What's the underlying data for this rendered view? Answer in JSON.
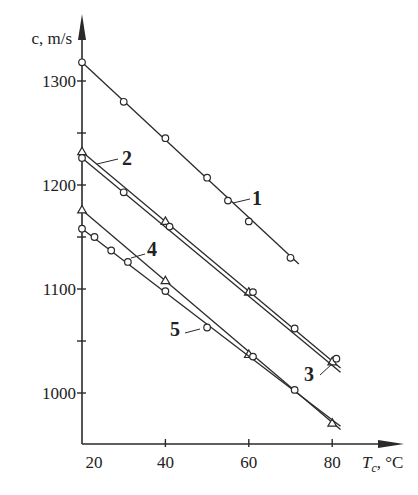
{
  "chart_data": {
    "type": "line",
    "title": "",
    "xlabel": "T_c, °C",
    "xlabel_main": "T",
    "xlabel_sub": "c",
    "xlabel_unit": ", °C",
    "ylabel": "c, m/s",
    "xlim": [
      20,
      87
    ],
    "ylim": [
      950,
      1330
    ],
    "x_ticks": [
      20,
      40,
      60,
      80
    ],
    "x_tick_labels": [
      "20",
      "40",
      "60",
      "80"
    ],
    "y_ticks": [
      1000,
      1100,
      1200,
      1300
    ],
    "y_tick_labels": [
      "1000",
      "1100",
      "1200",
      "1300"
    ],
    "y_minor_ticks": [
      1050,
      1150,
      1250
    ],
    "grid": false,
    "legend": "inline numeric labels",
    "series": [
      {
        "name": "1",
        "marker": "circle",
        "x": [
          20,
          30,
          40,
          50,
          55,
          60,
          70
        ],
        "y": [
          1318,
          1280,
          1245,
          1207,
          1185,
          1165,
          1130
        ],
        "line_x": [
          20,
          72
        ],
        "line_y": [
          1318,
          1124
        ]
      },
      {
        "name": "2",
        "marker": "triangle",
        "x": [
          20,
          40,
          60,
          80
        ],
        "y": [
          1232,
          1165,
          1097,
          1030
        ],
        "line_x": [
          20,
          82
        ],
        "line_y": [
          1232,
          1024
        ]
      },
      {
        "name": "3",
        "marker": "circle",
        "x": [
          20,
          30,
          41,
          61,
          71,
          81
        ],
        "y": [
          1226,
          1193,
          1160,
          1097,
          1062,
          1033
        ],
        "line_x": [
          20,
          82
        ],
        "line_y": [
          1226,
          1020
        ]
      },
      {
        "name": "4",
        "marker": "triangle",
        "x": [
          20,
          40,
          60,
          80
        ],
        "y": [
          1176,
          1108,
          1037,
          971
        ],
        "line_x": [
          20,
          82
        ],
        "line_y": [
          1176,
          965
        ]
      },
      {
        "name": "5",
        "marker": "circle",
        "x": [
          20,
          23,
          27,
          31,
          40,
          50,
          61,
          71
        ],
        "y": [
          1158,
          1150,
          1137,
          1126,
          1098,
          1063,
          1035,
          1003
        ],
        "line_x": [
          20,
          82
        ],
        "line_y": [
          1158,
          968
        ]
      }
    ],
    "annotations": [
      {
        "text": "1",
        "target_series": "1"
      },
      {
        "text": "2",
        "target_series": "2"
      },
      {
        "text": "3",
        "target_series": "3"
      },
      {
        "text": "4",
        "target_series": "4"
      },
      {
        "text": "5",
        "target_series": "5"
      }
    ]
  },
  "axes": {
    "y_title": "c, m/s",
    "x_title_main": "T",
    "x_title_sub": "c",
    "x_title_unit": ", °C"
  },
  "colors": {
    "ink": "#2a2a2a",
    "background": "#ffffff"
  }
}
